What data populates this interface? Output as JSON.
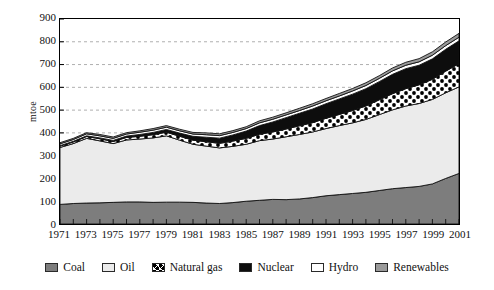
{
  "chart_data": {
    "type": "area",
    "title": "",
    "subtitle": "",
    "xlabel": "",
    "ylabel": "mtoe",
    "stacked": true,
    "grid": true,
    "grid_axis": "y",
    "legend_position": "bottom",
    "xlim": [
      1971,
      2001
    ],
    "ylim": [
      0,
      900
    ],
    "ytick_values": [
      0,
      100,
      200,
      300,
      400,
      500,
      600,
      700,
      800,
      900
    ],
    "ytick_labels": [
      "0",
      "100",
      "200",
      "300",
      "400",
      "500",
      "600",
      "700",
      "800",
      "900"
    ],
    "xtick_labels": [
      "1971",
      "1973",
      "1975",
      "1977",
      "1979",
      "1981",
      "1983",
      "1985",
      "1987",
      "1989",
      "1991",
      "1993",
      "1995",
      "1997",
      "1999",
      "2001"
    ],
    "x": [
      1971,
      1972,
      1973,
      1974,
      1975,
      1976,
      1977,
      1978,
      1979,
      1980,
      1981,
      1982,
      1983,
      1984,
      1985,
      1986,
      1987,
      1988,
      1989,
      1990,
      1991,
      1992,
      1993,
      1994,
      1995,
      1996,
      1997,
      1998,
      1999,
      2000,
      2001
    ],
    "series": [
      {
        "name": "Coal",
        "color": "#7d7d7d",
        "pattern": "solid",
        "values": [
          86,
          90,
          92,
          93,
          95,
          97,
          97,
          95,
          96,
          96,
          95,
          92,
          90,
          94,
          100,
          104,
          108,
          107,
          110,
          116,
          124,
          129,
          134,
          139,
          147,
          155,
          160,
          165,
          176,
          200,
          222
        ]
      },
      {
        "name": "Oil",
        "color": "#ebebeb",
        "pattern": "solid",
        "values": [
          250,
          263,
          284,
          272,
          258,
          272,
          276,
          283,
          291,
          272,
          255,
          250,
          244,
          247,
          250,
          262,
          265,
          276,
          283,
          288,
          295,
          303,
          310,
          320,
          333,
          346,
          358,
          364,
          371,
          376,
          380
        ]
      },
      {
        "name": "Natural gas",
        "color": "#ffffff",
        "pattern": "checker",
        "values": [
          6,
          7,
          8,
          9,
          9,
          11,
          12,
          14,
          16,
          17,
          18,
          19,
          20,
          23,
          26,
          28,
          31,
          34,
          38,
          41,
          45,
          49,
          54,
          59,
          65,
          71,
          76,
          82,
          88,
          95,
          102
        ]
      },
      {
        "name": "Nuclear",
        "color": "#0d0d0d",
        "pattern": "solid",
        "values": [
          2,
          3,
          3,
          4,
          5,
          6,
          8,
          10,
          12,
          14,
          17,
          20,
          23,
          27,
          32,
          38,
          44,
          50,
          55,
          60,
          64,
          68,
          72,
          76,
          80,
          85,
          88,
          86,
          90,
          96,
          100
        ]
      },
      {
        "name": "Hydro",
        "color": "#ffffff",
        "pattern": "solid",
        "values": [
          8,
          8,
          9,
          9,
          9,
          9,
          10,
          10,
          10,
          10,
          10,
          11,
          11,
          11,
          11,
          12,
          12,
          12,
          12,
          13,
          13,
          13,
          14,
          14,
          14,
          15,
          15,
          15,
          16,
          16,
          16
        ]
      },
      {
        "name": "Renewables",
        "color": "#9a9a9a",
        "pattern": "solid",
        "values": [
          5,
          5,
          5,
          6,
          6,
          6,
          6,
          7,
          7,
          7,
          7,
          8,
          8,
          8,
          8,
          9,
          9,
          9,
          10,
          10,
          10,
          11,
          11,
          12,
          12,
          13,
          13,
          14,
          15,
          16,
          17
        ]
      }
    ]
  },
  "legend": {
    "items": [
      {
        "label": "Coal",
        "swatch": "coal-swatch"
      },
      {
        "label": "Oil",
        "swatch": "oil-swatch"
      },
      {
        "label": "Natural gas",
        "swatch": "natural-gas-swatch"
      },
      {
        "label": "Nuclear",
        "swatch": "nuclear-swatch"
      },
      {
        "label": "Hydro",
        "swatch": "hydro-swatch"
      },
      {
        "label": "Renewables",
        "swatch": "renewables-swatch"
      }
    ]
  },
  "axes": {
    "y_axis_title": "mtoe"
  },
  "colors": {
    "coal": "#7d7d7d",
    "oil": "#ebebeb",
    "natural_gas": "#ffffff",
    "nuclear": "#0d0d0d",
    "hydro": "#ffffff",
    "renewables": "#9a9a9a",
    "gridline": "#9b9b9b",
    "frame": "#000000"
  }
}
